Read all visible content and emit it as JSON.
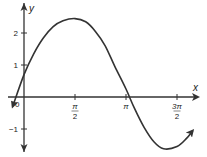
{
  "chart_data": {
    "type": "line",
    "title": "",
    "xlabel": "x",
    "ylabel": "y",
    "origin_label": "0",
    "x_ticks": [
      {
        "value": 1.5708,
        "label_num": "π",
        "label_den": "2"
      },
      {
        "value": 3.1416,
        "label_num": "π",
        "label_den": ""
      },
      {
        "value": 4.7124,
        "label_num": "3π",
        "label_den": "2"
      }
    ],
    "y_ticks": [
      {
        "value": -1,
        "label": "−1"
      },
      {
        "value": 1,
        "label": "1"
      },
      {
        "value": 2,
        "label": "2"
      }
    ],
    "series": [
      {
        "name": "curve",
        "x": [
          -0.35,
          0,
          0.3,
          0.6,
          0.9,
          1.2,
          1.5708,
          1.9,
          2.2,
          2.5,
          2.8,
          3.1416,
          3.4,
          3.7,
          4.0,
          4.3,
          4.7124,
          5.0,
          5.2
        ],
        "y": [
          -0.3,
          0.7,
          1.35,
          1.85,
          2.2,
          2.38,
          2.45,
          2.35,
          2.05,
          1.6,
          0.95,
          0.25,
          -0.35,
          -0.95,
          -1.4,
          -1.62,
          -1.55,
          -1.3,
          -1.05
        ]
      }
    ],
    "xlim": [
      -0.5,
      5.3
    ],
    "ylim": [
      -1.7,
      3.0
    ],
    "grid": false,
    "legend": null,
    "colors": {
      "line": "#333333",
      "axis": "#333333"
    }
  }
}
